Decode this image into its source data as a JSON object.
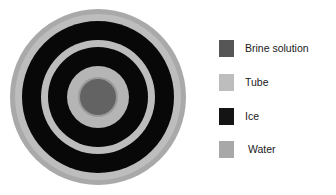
{
  "figure": {
    "name": "concentric-tube-cross-section",
    "center_x": 98,
    "center_y": 97,
    "rings": [
      {
        "name": "water-outer-ring",
        "material": "Water",
        "radius": 88,
        "color": "#a9a9a9"
      },
      {
        "name": "tube-outer-wall-ring",
        "material": "Tube",
        "radius": 83,
        "color": "#bdbdbd"
      },
      {
        "name": "ice-outer-band",
        "material": "Ice",
        "radius": 76,
        "color": "#080808"
      },
      {
        "name": "tube-mid-outer-ring",
        "material": "Tube",
        "radius": 57,
        "color": "#bdbdbd"
      },
      {
        "name": "ice-inner-band",
        "material": "Ice",
        "radius": 50,
        "color": "#080808"
      },
      {
        "name": "tube-inner-ring",
        "material": "Tube",
        "radius": 31,
        "color": "#b5b5b5"
      },
      {
        "name": "tube-inner-wall-outline",
        "material": "Tube",
        "radius": 20,
        "color": "#9a9a9a"
      },
      {
        "name": "brine-core-circle",
        "material": "Brine solution",
        "radius": 18,
        "color": "#636363"
      }
    ]
  },
  "legend": {
    "name": "materials-legend",
    "items": [
      {
        "label": "Brine solution",
        "color": "#565656"
      },
      {
        "label": "Tube",
        "color": "#bdbdbd"
      },
      {
        "label": "Ice",
        "color": "#141414"
      },
      {
        "label": "Water",
        "color": "#a8a8a8"
      }
    ]
  }
}
